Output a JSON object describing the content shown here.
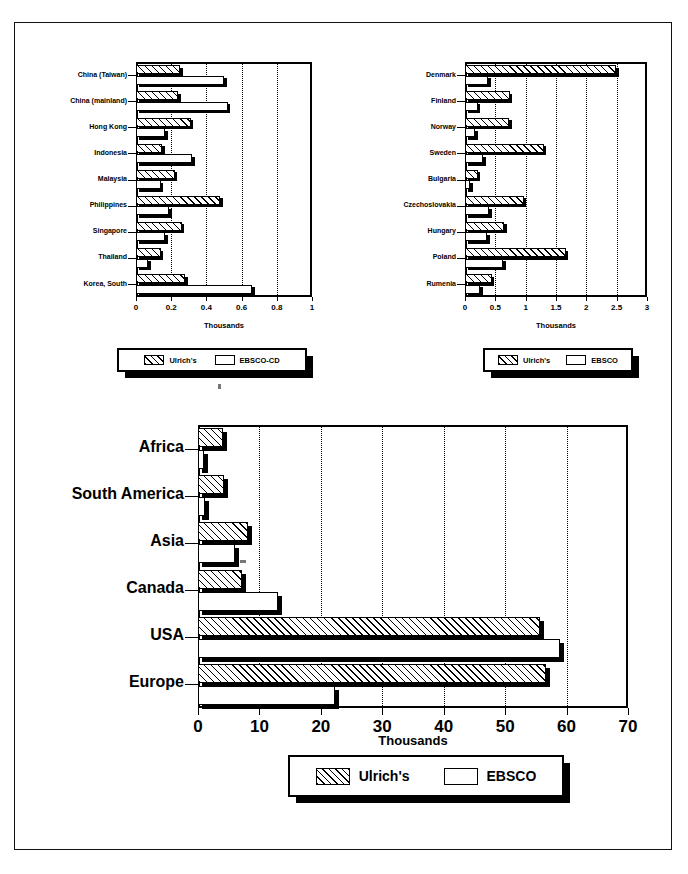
{
  "page": {
    "background": "#ffffff",
    "border_color": "#111111"
  },
  "charts": [
    {
      "id": "asia-chart",
      "position": "top-left",
      "xlabel": "Thousands",
      "legend": [
        {
          "name": "Ulrich's",
          "fill": "hatch"
        },
        {
          "name": "EBSCO-CD",
          "fill": "white"
        }
      ]
    },
    {
      "id": "europe-chart",
      "position": "top-right",
      "xlabel": "Thousands",
      "legend": [
        {
          "name": "Ulrich's",
          "fill": "hatch"
        },
        {
          "name": "EBSCO",
          "fill": "white"
        }
      ]
    },
    {
      "id": "world-chart",
      "position": "bottom",
      "xlabel": "Thousands",
      "legend": [
        {
          "name": "Ulrich's",
          "fill": "hatch"
        },
        {
          "name": "EBSCO",
          "fill": "white"
        }
      ]
    }
  ],
  "chart_data": [
    {
      "type": "bar",
      "orientation": "horizontal",
      "id": "asia-chart",
      "title": "",
      "xlabel": "Thousands",
      "ylabel": "",
      "xlim": [
        0,
        1
      ],
      "xticks": [
        0,
        0.2,
        0.4,
        0.6,
        0.8,
        1
      ],
      "xticklabels": [
        "0",
        "0.2",
        "0.4",
        "0.6",
        "0.8",
        "1"
      ],
      "grid": "vertical-dotted",
      "legend_position": "below",
      "categories": [
        "China (Taiwan)",
        "China (mainland)",
        "Hong Kong",
        "Indonesia",
        "Malaysia",
        "Philippines",
        "Singapore",
        "Thailand",
        "Korea, South"
      ],
      "series": [
        {
          "name": "Ulrich's",
          "values": [
            0.25,
            0.24,
            0.31,
            0.15,
            0.22,
            0.48,
            0.26,
            0.14,
            0.28
          ]
        },
        {
          "name": "EBSCO-CD",
          "values": [
            0.5,
            0.52,
            0.165,
            0.32,
            0.14,
            0.19,
            0.165,
            0.07,
            0.66
          ]
        }
      ]
    },
    {
      "type": "bar",
      "orientation": "horizontal",
      "id": "europe-chart",
      "title": "",
      "xlabel": "Thousands",
      "ylabel": "",
      "xlim": [
        0,
        3
      ],
      "xticks": [
        0,
        0.5,
        1,
        1.5,
        2,
        2.5,
        3
      ],
      "xticklabels": [
        "0",
        "0.5",
        "1",
        "1.5",
        "2",
        "2.5",
        "3"
      ],
      "grid": "vertical-dotted",
      "legend_position": "below",
      "categories": [
        "Denmark",
        "Finland",
        "Norway",
        "Sweden",
        "Bulgaria",
        "Czechoslovakia",
        "Hungary",
        "Poland",
        "Rumenia"
      ],
      "series": [
        {
          "name": "Ulrich's",
          "values": [
            2.49,
            0.74,
            0.73,
            1.3,
            0.21,
            0.97,
            0.65,
            1.66,
            0.44
          ]
        },
        {
          "name": "EBSCO",
          "values": [
            0.38,
            0.21,
            0.17,
            0.3,
            0.09,
            0.4,
            0.37,
            0.63,
            0.25
          ]
        }
      ]
    },
    {
      "type": "bar",
      "orientation": "horizontal",
      "id": "world-chart",
      "title": "",
      "xlabel": "Thousands",
      "ylabel": "",
      "xlim": [
        0,
        70
      ],
      "xticks": [
        0,
        10,
        20,
        30,
        40,
        50,
        60,
        70
      ],
      "xticklabels": [
        "0",
        "10",
        "20",
        "30",
        "40",
        "50",
        "60",
        "70"
      ],
      "grid": "vertical-dotted",
      "legend_position": "below",
      "categories": [
        "Africa",
        "South America",
        "Asia",
        "Canada",
        "USA",
        "Europe"
      ],
      "series": [
        {
          "name": "Ulrich's",
          "values": [
            4.0,
            4.2,
            8.1,
            7.1,
            55.7,
            56.7
          ]
        },
        {
          "name": "EBSCO",
          "values": [
            0.9,
            1.1,
            6.0,
            13.0,
            58.9,
            22.3
          ]
        }
      ]
    }
  ]
}
